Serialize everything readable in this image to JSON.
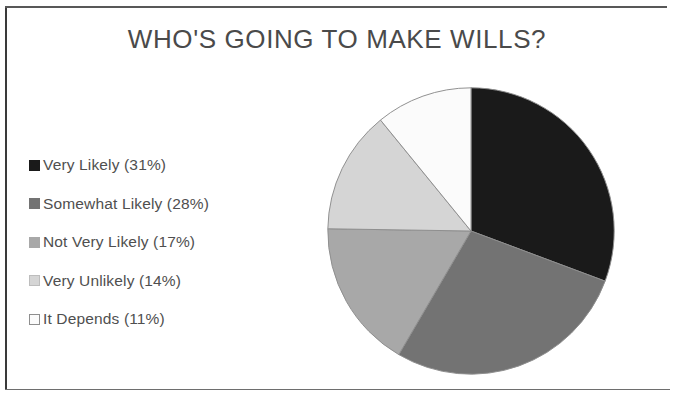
{
  "document": {
    "kind": "scanned-page-figure",
    "background_color": "#ffffff",
    "frame_color": "#3a3a3a"
  },
  "chart": {
    "title": "WHO'S GOING TO MAKE WILLS?",
    "title_color": "#4a4a4a",
    "legend_text_color": "#4f4f4f"
  },
  "legend": {
    "items": [
      {
        "label": "Very Likely (31%)",
        "color": "#1a1a1a",
        "border": "#1a1a1a"
      },
      {
        "label": "Somewhat Likely (28%)",
        "color": "#737373",
        "border": "#737373"
      },
      {
        "label": "Not Very Likely (17%)",
        "color": "#a8a8a8",
        "border": "#a8a8a8"
      },
      {
        "label": "Very Unlikely (14%)",
        "color": "#d5d5d5",
        "border": "#bdbdbd"
      },
      {
        "label": "It Depends (11%)",
        "color": "#fbfbfb",
        "border": "#8e8e8e"
      }
    ]
  },
  "chart_data": {
    "type": "pie",
    "title": "WHO'S GOING TO MAKE WILLS?",
    "xlabel": "",
    "ylabel": "",
    "unit": "percent",
    "total": 101,
    "start_angle_deg": 0,
    "direction": "clockwise",
    "legend_position": "left",
    "grid": false,
    "categories": [
      "Very Likely",
      "Somewhat Likely",
      "Not Very Likely",
      "Very Unlikely",
      "It Depends"
    ],
    "values": [
      31,
      28,
      17,
      14,
      11
    ],
    "labels": [
      "Very Likely (31%)",
      "Somewhat Likely (28%)",
      "Not Very Likely (17%)",
      "Very Unlikely (14%)",
      "It Depends (11%)"
    ],
    "colors": [
      "#1a1a1a",
      "#737373",
      "#a8a8a8",
      "#d5d5d5",
      "#fbfbfb"
    ],
    "slice_border_color": "#8e8e8e",
    "geometry": {
      "center_x": 154,
      "center_y": 154,
      "radius": 147
    }
  }
}
